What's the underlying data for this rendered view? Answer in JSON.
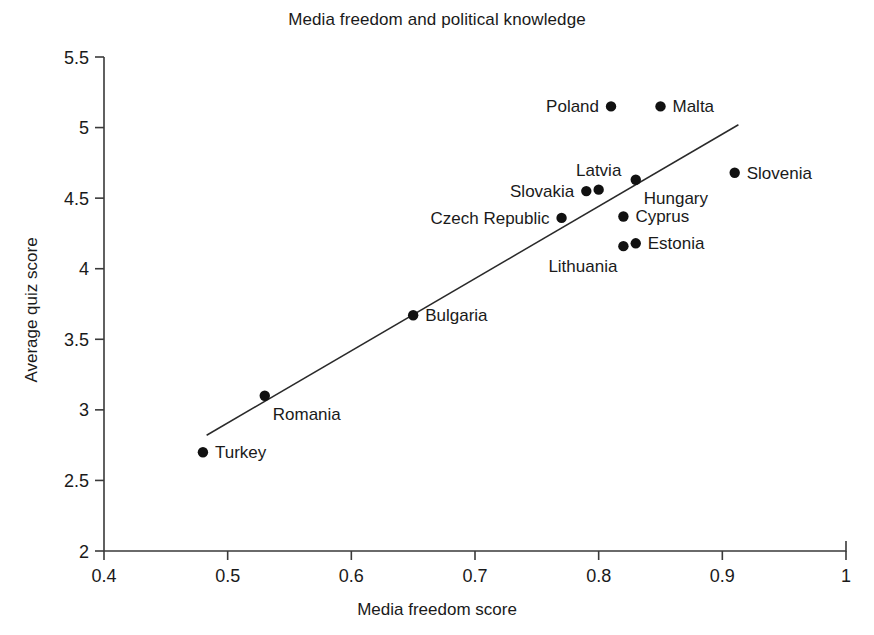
{
  "chart_data": {
    "type": "scatter",
    "title": "Media freedom and political knowledge",
    "xlabel": "Media freedom score",
    "ylabel": "Average quiz score",
    "xlim": [
      0.4,
      1.0
    ],
    "ylim": [
      2,
      5.5
    ],
    "xticks": [
      "0.4",
      "0.5",
      "0.6",
      "0.7",
      "0.8",
      "0.9",
      "1"
    ],
    "xtick_values": [
      0.4,
      0.5,
      0.6,
      0.7,
      0.8,
      0.9,
      1.0
    ],
    "yticks": [
      "2",
      "2.5",
      "3",
      "3.5",
      "4",
      "4.5",
      "5",
      "5.5"
    ],
    "ytick_values": [
      2,
      2.5,
      3,
      3.5,
      4,
      4.5,
      5,
      5.5
    ],
    "grid": false,
    "legend": "none",
    "marker_color": "#111111",
    "trend_line": {
      "present": true,
      "color": "#2a2a2a",
      "x_start": 0.483,
      "y_start": 2.82,
      "x_end": 0.913,
      "y_end": 5.02
    },
    "points": [
      {
        "label": "Poland",
        "x": 0.81,
        "y": 5.15,
        "label_pos": "left"
      },
      {
        "label": "Malta",
        "x": 0.85,
        "y": 5.15,
        "label_pos": "right"
      },
      {
        "label": "Slovenia",
        "x": 0.91,
        "y": 4.68,
        "label_pos": "right"
      },
      {
        "label": "Hungary",
        "x": 0.83,
        "y": 4.63,
        "label_pos": "below-right"
      },
      {
        "label": "Latvia",
        "x": 0.8,
        "y": 4.56,
        "label_pos": "above"
      },
      {
        "label": "Slovakia",
        "x": 0.79,
        "y": 4.55,
        "label_pos": "left"
      },
      {
        "label": "Cyprus",
        "x": 0.82,
        "y": 4.37,
        "label_pos": "right"
      },
      {
        "label": "Czech Republic",
        "x": 0.77,
        "y": 4.36,
        "label_pos": "left"
      },
      {
        "label": "Estonia",
        "x": 0.83,
        "y": 4.18,
        "label_pos": "right"
      },
      {
        "label": "Lithuania",
        "x": 0.82,
        "y": 4.16,
        "label_pos": "below-left"
      },
      {
        "label": "Bulgaria",
        "x": 0.65,
        "y": 3.67,
        "label_pos": "right"
      },
      {
        "label": "Romania",
        "x": 0.53,
        "y": 3.1,
        "label_pos": "below-right"
      },
      {
        "label": "Turkey",
        "x": 0.48,
        "y": 2.7,
        "label_pos": "right"
      }
    ]
  }
}
